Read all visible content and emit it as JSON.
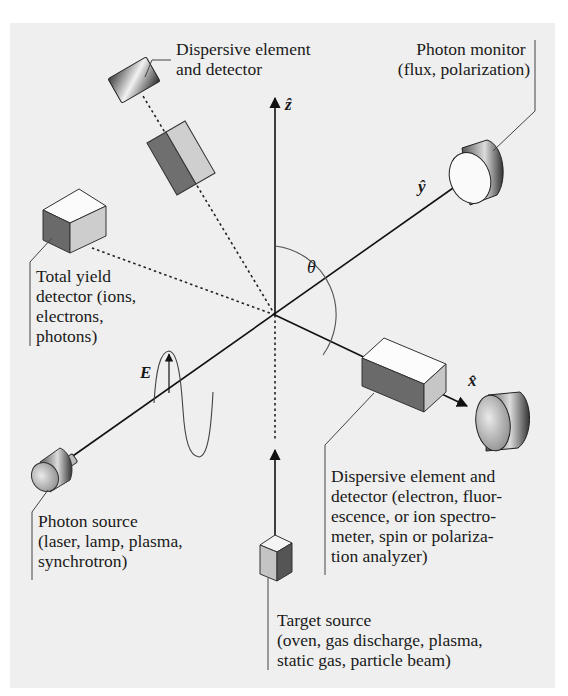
{
  "figure": {
    "background_color": "#efefef",
    "axes": {
      "z_label": "ẑ",
      "y_label": "ŷ",
      "x_label": "x̂",
      "angle_label": "θ",
      "field_label": "E"
    },
    "labels": {
      "dispersive_top": [
        "Dispersive element",
        "and detector"
      ],
      "photon_monitor": [
        "Photon monitor",
        "(flux, polarization)"
      ],
      "total_yield": [
        "Total yield",
        "detector (ions,",
        "electrons,",
        "photons)"
      ],
      "dispersive_bottom": [
        "Dispersive element and",
        "detector (electron, fluor-",
        "escence, or ion spectro-",
        "meter, spin or polariza-",
        "tion analyzer)"
      ],
      "photon_source": [
        "Photon source",
        "(laser, lamp, plasma,",
        "synchrotron)"
      ],
      "target_source": [
        "Target source",
        "(oven, gas discharge, plasma,",
        "static gas, particle beam)"
      ]
    }
  }
}
